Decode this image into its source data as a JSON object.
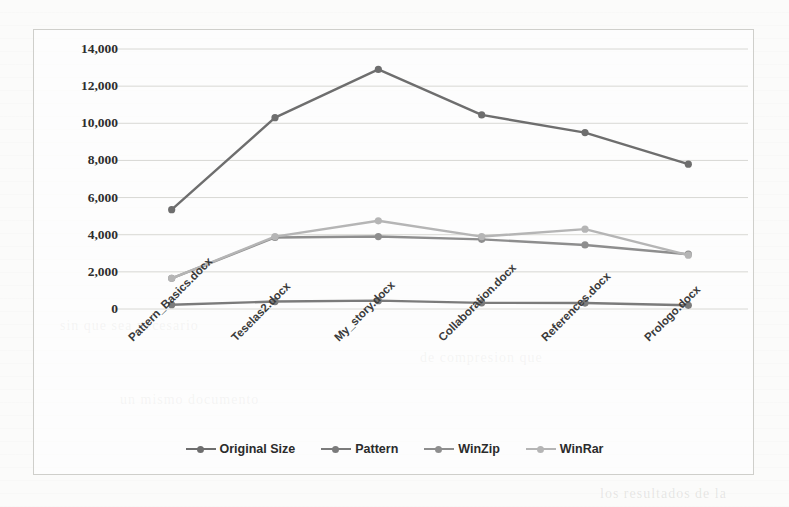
{
  "chart_data": {
    "type": "line",
    "title": "",
    "xlabel": "",
    "ylabel": "",
    "categories": [
      "Pattern_Basics.docx",
      "Teselas2.docx",
      "My_story.docx",
      "Collaboration.docx",
      "References.docx",
      "Prologo.docx"
    ],
    "yticks": [
      "0",
      "2,000",
      "4,000",
      "6,000",
      "8,000",
      "10,000",
      "12,000",
      "14,000"
    ],
    "ytick_values": [
      0,
      2000,
      4000,
      6000,
      8000,
      10000,
      12000,
      14000
    ],
    "ylim": [
      0,
      14000
    ],
    "grid": true,
    "legend_position": "bottom",
    "series": [
      {
        "name": "Original Size",
        "color": "#6e6e6e",
        "values": [
          5350,
          10300,
          12900,
          10450,
          9500,
          7800
        ]
      },
      {
        "name": "Pattern",
        "color": "#7b7b7b",
        "values": [
          230,
          400,
          450,
          330,
          320,
          200
        ]
      },
      {
        "name": "WinZip",
        "color": "#8e8e8e",
        "values": [
          1650,
          3850,
          3900,
          3750,
          3450,
          2950
        ]
      },
      {
        "name": "WinRar",
        "color": "#b5b5b5",
        "values": [
          1650,
          3900,
          4750,
          3900,
          4300,
          2900
        ]
      }
    ]
  },
  "legend": {
    "items": [
      {
        "label": "Original Size"
      },
      {
        "label": "Pattern"
      },
      {
        "label": "WinZip"
      },
      {
        "label": "WinRar"
      }
    ]
  },
  "background_text": {
    "lines": [
      "sin que sea necesario",
      "un mismo documento",
      "de compresion que",
      "los resultados de la"
    ]
  }
}
